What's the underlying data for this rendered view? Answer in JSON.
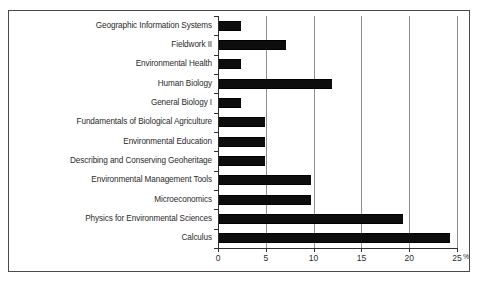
{
  "chart_data": {
    "type": "bar",
    "orientation": "horizontal",
    "title": "",
    "subtitle": "",
    "xlabel": "%",
    "ylabel": "",
    "categories": [
      "Geographic Information Systems",
      "Fieldwork II",
      "Environmental Health",
      "Human Biology",
      "General Biology I",
      "Fundamentals of Biological Agriculture",
      "Environmental Education",
      "Describing and Conserving Geoheritage",
      "Environmental Management Tools",
      "Microeconomics",
      "Physics for Environmental Sciences",
      "Calculus"
    ],
    "values": [
      2.4,
      7.1,
      2.4,
      11.9,
      2.4,
      4.9,
      4.9,
      4.9,
      9.7,
      9.7,
      19.3,
      24.3
    ],
    "xlim": [
      0,
      25
    ],
    "xticks": [
      0,
      5,
      10,
      15,
      20,
      25
    ],
    "xtick_labels": [
      "0",
      "5",
      "10",
      "15",
      "20",
      "25"
    ],
    "unit": "%",
    "grid": "vertical",
    "legend": "none",
    "bar_color": "#0d0d0d",
    "gridline_color": "#8f8f8f",
    "axis_color": "#2f2f2f",
    "background_color": "#ffffff"
  }
}
